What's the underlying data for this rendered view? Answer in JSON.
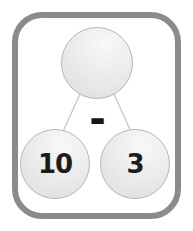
{
  "diagram": {
    "type": "number-bond",
    "operator": "-",
    "whole": {
      "value": ""
    },
    "parts": [
      {
        "value": "10"
      },
      {
        "value": "3"
      }
    ]
  },
  "colors": {
    "frame_border": "#8b8b8b",
    "circle_fill": "#e9e9e9",
    "circle_outline": "#b6b6b6",
    "connector_line": "#c9c9c9",
    "number_text": "#1c1c1c",
    "background": "#ffffff"
  }
}
